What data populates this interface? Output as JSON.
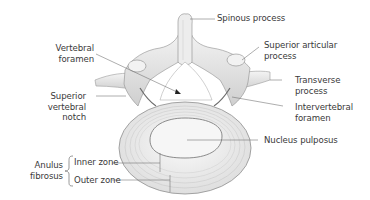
{
  "figure": {
    "colors": {
      "background": "#ffffff",
      "label_text": "#3a3a3a",
      "leader_line": "#6a6a6a",
      "bone_fill": "#ececec",
      "bone_shadow": "#9a9a9a",
      "disc_fill": "#f3f3f3",
      "disc_ring": "#b8b8b8"
    }
  },
  "labels": {
    "spinous_process": {
      "line1": "Spinous process"
    },
    "superior_articular_process": {
      "line1": "Superior articular",
      "line2": "process"
    },
    "transverse_process": {
      "line1": "Transverse",
      "line2": "process"
    },
    "intervertebral_foramen": {
      "line1": "Intervertebral",
      "line2": "foramen"
    },
    "nucleus_pulposus": {
      "line1": "Nucleus pulposus"
    },
    "vertebral_foramen": {
      "line1": "Vertebral",
      "line2": "foramen"
    },
    "superior_vertebral_notch": {
      "line1": "Superior",
      "line2": "vertebral",
      "line3": "notch"
    },
    "anulus_fibrosus": {
      "group_line1": "Anulus",
      "group_line2": "fibrosus",
      "inner_zone": "Inner zone",
      "outer_zone": "Outer zone"
    }
  }
}
